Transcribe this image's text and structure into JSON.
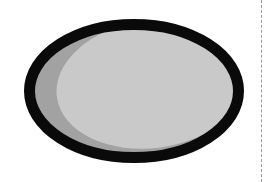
{
  "canvas": {
    "width": 268,
    "height": 182,
    "background": "#ffffff"
  },
  "figure": {
    "name": "shaded-ellipse",
    "outline": {
      "color": "#0a0a0a",
      "stroke_width": 11,
      "center_x": 134,
      "center_y": 91,
      "radius_x": 110,
      "radius_y": 72
    },
    "base_fill": {
      "label": "shadow-fill",
      "color": "#a2a2a2"
    },
    "highlight": {
      "label": "highlight-fill",
      "color": "#c9c9c9",
      "center_x": 152,
      "center_y": 84,
      "radius_x": 96,
      "radius_y": 64,
      "rotation_deg": -8
    }
  },
  "guide": {
    "name": "vertical-dashed-guide",
    "color": "#9a9a9a",
    "x": 261,
    "dash_on": 2,
    "dash_off": 3
  }
}
